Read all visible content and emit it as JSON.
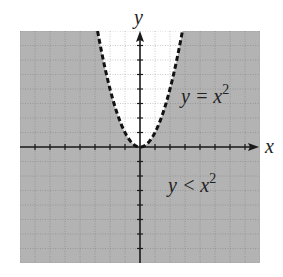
{
  "chart_data": {
    "type": "inequality-region",
    "title": "",
    "xlabel": "x",
    "ylabel": "y",
    "xlim": [
      -8,
      8
    ],
    "ylim": [
      -8,
      8
    ],
    "grid": true,
    "grid_step": 1,
    "tick_step": 1,
    "tick_labels": false,
    "boundary": {
      "equation": "y = x^2",
      "style": "dashed",
      "x": [
        -2.83,
        -2.5,
        -2,
        -1.5,
        -1,
        -0.5,
        0,
        0.5,
        1,
        1.5,
        2,
        2.5,
        2.83
      ],
      "y": [
        8,
        6.25,
        4,
        2.25,
        1,
        0.25,
        0,
        0.25,
        1,
        2.25,
        4,
        6.25,
        8
      ]
    },
    "shaded_region": "y < x^2",
    "annotations": [
      {
        "text_base": "y = x",
        "exponent": "2",
        "x": 2.7,
        "y": 3.0
      },
      {
        "text_base": "y < x",
        "exponent": "2",
        "x": 1.9,
        "y": -3.1
      }
    ]
  },
  "labels": {
    "x_axis": "x",
    "y_axis": "y",
    "boundary_base": "y = x",
    "boundary_exp": "2",
    "region_base": "y < x",
    "region_exp": "2"
  },
  "colors": {
    "shade": "#b3b3b3",
    "unshaded": "#ffffff",
    "grid_on_shade": "#8f8f8f",
    "grid_on_white": "#bdbdbd",
    "axis": "#1a1a1a",
    "curve": "#111111"
  }
}
